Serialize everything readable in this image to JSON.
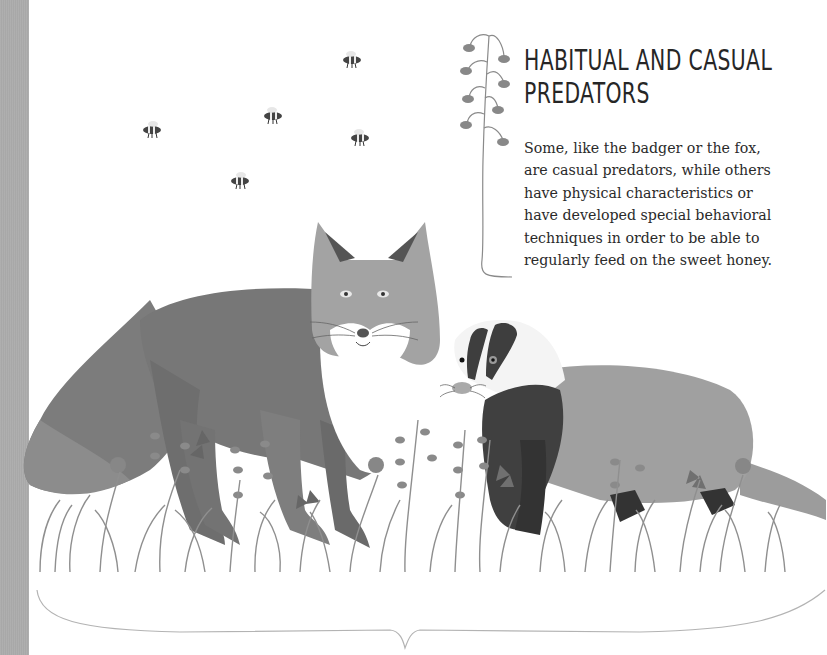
{
  "page": {
    "heading_lines": [
      "HABITUAL AND CASUAL",
      "PREDATORS"
    ],
    "body_lines": [
      "Some, like the badger or the fox,",
      "are casual predators, while others",
      "have physical characteristics or",
      "have developed special behavioral",
      "techniques in order to be able to",
      "regularly feed on the sweet honey."
    ]
  },
  "illustration": {
    "subjects": [
      "fox-illustration",
      "badger-illustration",
      "bee-illustration",
      "flowers-illustration",
      "grass-illustration"
    ],
    "bee_count": 5,
    "palette": {
      "strip": "#a8a8a8",
      "fox_body": "#7a7a7a",
      "fox_head": "#a3a3a3",
      "fox_dark": "#5f5f5f",
      "badger_body": "#a0a0a0",
      "badger_dark": "#3a3a3a",
      "flower": "#8a8a8a",
      "grass": "#9a9a9a",
      "text": "#2a2a2a"
    }
  }
}
